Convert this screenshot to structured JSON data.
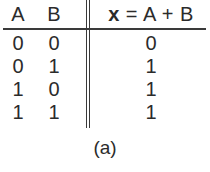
{
  "figure": {
    "caption": "(a)",
    "colors": {
      "ink": "#2b2b2b",
      "rule": "#3a3a3a",
      "background": "#ffffff"
    }
  },
  "table": {
    "headers": {
      "input_a": "A",
      "input_b": "B",
      "output_var": "x",
      "output_operator": " = A + B",
      "output_full": "x = A + B"
    },
    "rows": [
      {
        "a": "0",
        "b": "0",
        "x": "0"
      },
      {
        "a": "0",
        "b": "1",
        "x": "1"
      },
      {
        "a": "1",
        "b": "0",
        "x": "1"
      },
      {
        "a": "1",
        "b": "1",
        "x": "1"
      }
    ]
  }
}
